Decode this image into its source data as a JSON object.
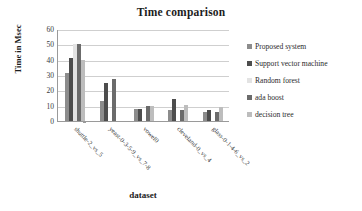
{
  "chart_data": {
    "type": "bar",
    "title": "Time comparison",
    "xlabel": "dataset",
    "ylabel": "Time in Msec",
    "ylim": [
      0,
      60
    ],
    "ytick_step": 10,
    "yticks": [
      60,
      50,
      40,
      30,
      20,
      10,
      0
    ],
    "grid": true,
    "legend_position": "right",
    "categories": [
      "shuttle-2_vs_5",
      "yeast-0-3-5-9_vs_7-8",
      "vowel0",
      "cleveland-0_vs_4",
      "glass-0-1-4-6_vs_2"
    ],
    "series": [
      {
        "name": "Proposed system",
        "color": "#8c8c8c",
        "values": [
          31,
          13,
          8,
          7.5,
          6
        ]
      },
      {
        "name": "Support  vector  machine",
        "color": "#4d4d4d",
        "values": [
          41,
          25,
          8,
          14.5,
          7.5
        ]
      },
      {
        "name": "Random forest",
        "color": "#e3e3e3",
        "values": [
          50,
          0,
          0,
          0,
          0
        ]
      },
      {
        "name": "ada boost",
        "color": "#6b6b6b",
        "values": [
          50,
          27.5,
          10,
          7,
          6
        ]
      },
      {
        "name": "decision tree",
        "color": "#bdbdbd",
        "values": [
          39.5,
          0,
          10,
          10.5,
          9
        ]
      }
    ]
  }
}
